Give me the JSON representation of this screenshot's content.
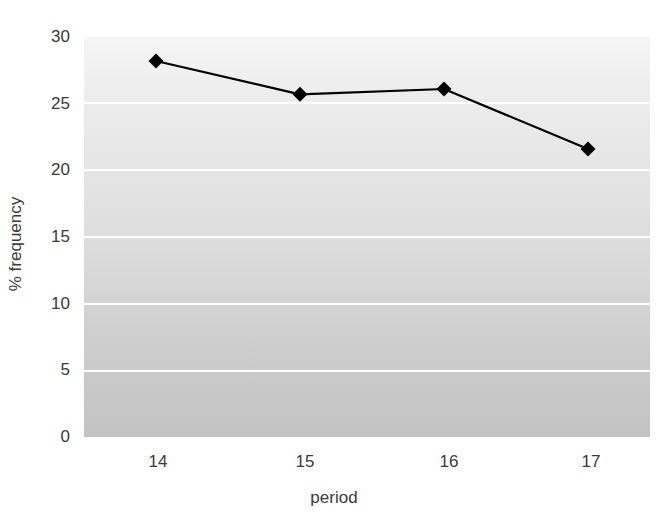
{
  "chart_data": {
    "type": "line",
    "title": "",
    "xlabel": "period",
    "ylabel": "% frequency",
    "categories": [
      "14",
      "15",
      "16",
      "17"
    ],
    "x": [
      14,
      15,
      16,
      17
    ],
    "values": [
      28.2,
      25.7,
      26.1,
      21.6
    ],
    "series": [
      {
        "name": "% frequency",
        "values": [
          28.2,
          25.7,
          26.1,
          21.6
        ],
        "line_color": "#000000",
        "marker": "diamond",
        "marker_color": "#000000"
      }
    ],
    "ylim": [
      0,
      30
    ],
    "yticks": [
      0,
      5,
      10,
      15,
      20,
      25,
      30
    ],
    "ytick_labels": [
      "0",
      "5",
      "10",
      "15",
      "20",
      "25",
      "30"
    ],
    "xtick_labels": [
      "14",
      "15",
      "16",
      "17"
    ],
    "grid": "horizontal",
    "gridline_color": "#ffffff",
    "legend": "none",
    "plot_background": "vertical-gradient-light-to-gray",
    "background_top_color": "#f5f5f5",
    "background_bottom_color": "#c3c3c3",
    "figure_background": "#ffffff",
    "text_color": "#3a3a3a"
  },
  "axes": {
    "y_tick_0": "0",
    "y_tick_1": "5",
    "y_tick_2": "10",
    "y_tick_3": "15",
    "y_tick_4": "20",
    "y_tick_5": "25",
    "y_tick_6": "30",
    "x_tick_0": "14",
    "x_tick_1": "15",
    "x_tick_2": "16",
    "x_tick_3": "17",
    "x_axis_title": "period",
    "y_axis_title": "% frequency"
  }
}
